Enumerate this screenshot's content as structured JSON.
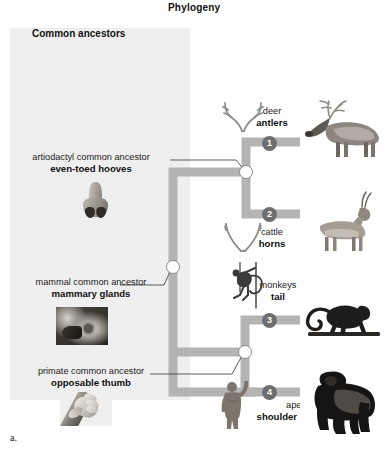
{
  "figure": {
    "title": "Phylogeny",
    "part_letter": "a."
  },
  "left_panel": {
    "heading": "Common ancestors",
    "background_color": "#efefef"
  },
  "ancestors": [
    {
      "id": "artiodactyl",
      "label": "artiodactyl common ancestor",
      "trait": "even-toed hooves",
      "image_name": "hoof-photo"
    },
    {
      "id": "mammal",
      "label": "mammal common ancestor",
      "trait": "mammary glands",
      "image_name": "mammary-glands-photo"
    },
    {
      "id": "primate",
      "label": "primate common ancestor",
      "trait": "opposable thumb",
      "image_name": "opposable-thumb-photo"
    }
  ],
  "taxa": [
    {
      "id": "deer",
      "badge": "1",
      "common_name": "deer",
      "trait": "antlers",
      "sketch_name": "antlers-sketch",
      "photo_name": "deer-photo"
    },
    {
      "id": "cattle",
      "badge": "2",
      "common_name": "cattle",
      "trait": "horns",
      "sketch_name": "horns-sketch",
      "photo_name": "antelope-photo"
    },
    {
      "id": "monkeys",
      "badge": "3",
      "common_name": "monkeys",
      "trait": "tail",
      "sketch_name": "monkey-tail-sketch",
      "photo_name": "monkey-photo"
    },
    {
      "id": "apes",
      "badge": "4",
      "common_name": "apes",
      "trait": "shoulder rotation",
      "sketch_name": "shoulder-rotation-sketch",
      "photo_name": "gorilla-photo"
    }
  ],
  "colors": {
    "branch": "#b4b4b4",
    "badge": "#6e6e6e",
    "panel": "#efefef",
    "node_stroke": "#8a8a8a",
    "leader_line": "#4a4a4a"
  }
}
